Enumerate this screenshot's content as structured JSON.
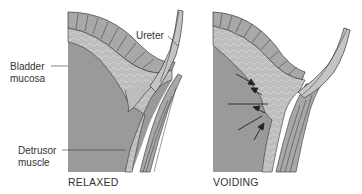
{
  "diagram": {
    "panels": [
      {
        "id": "relaxed",
        "caption": "RELAXED"
      },
      {
        "id": "voiding",
        "caption": "VOIDING"
      }
    ],
    "labels": {
      "ureter": "Ureter",
      "bladder_mucosa_line1": "Bladder",
      "bladder_mucosa_line2": "mucosa",
      "detrusor_line1": "Detrusor",
      "detrusor_line2": "muscle"
    },
    "colors": {
      "lumen": "#9a9a9a",
      "mucosa": "#b9b9b9",
      "muscle": "#a8a8a8",
      "ureter": "#c4c4c4",
      "stroke": "#333333"
    }
  }
}
